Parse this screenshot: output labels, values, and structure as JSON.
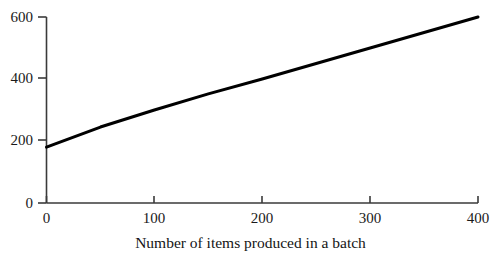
{
  "chart_data": {
    "type": "line",
    "title": "",
    "subtitle": "",
    "xlabel": "Number of items produced in a batch",
    "ylabel": "",
    "x": [
      0,
      50,
      100,
      150,
      200,
      250,
      300,
      350,
      400
    ],
    "values": [
      180,
      245,
      300,
      352,
      400,
      450,
      500,
      550,
      600
    ],
    "series": [
      {
        "name": "Total cost",
        "values": [
          180,
          245,
          300,
          352,
          400,
          450,
          500,
          550,
          600
        ]
      }
    ],
    "xlim": [
      0,
      400
    ],
    "ylim": [
      0,
      620
    ],
    "xticks": [
      0,
      100,
      200,
      300,
      400
    ],
    "yticks": [
      0,
      200,
      400,
      600
    ],
    "xtick_labels": [
      "0",
      "100",
      "200",
      "300",
      "400"
    ],
    "ytick_labels": [
      "0",
      "200",
      "400",
      "600"
    ],
    "grid": false,
    "legend": false,
    "legend_position": "none",
    "line_color": "#000000",
    "line_width": 3,
    "axis_color": "#3a3a3a",
    "background_color": "#ffffff"
  },
  "axes": {
    "x_title": "Number of items produced in a batch",
    "y_title": ""
  }
}
